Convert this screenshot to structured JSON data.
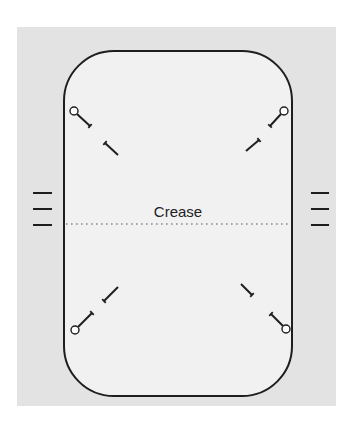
{
  "diagram": {
    "crease_label": "Crease",
    "colors": {
      "page_background": "#ffffff",
      "panel_fill": "#e3e3e3",
      "card_fill": "#f1f1f1",
      "stroke": "#1e1e1e",
      "crease_dots": "#8a8a8a",
      "pin_head_fill": "#ffffff"
    },
    "panel": {
      "x": 17,
      "y": 27,
      "width": 319,
      "height": 379
    },
    "card": {
      "x": 64,
      "y": 51,
      "width": 228,
      "height": 345,
      "corner_radius": 50
    },
    "crease": {
      "y": 224,
      "x1": 66,
      "x2": 290
    },
    "tick_marks": {
      "left": {
        "x1": 33,
        "x2": 52,
        "ys": [
          193,
          209,
          225
        ]
      },
      "right": {
        "x1": 311,
        "x2": 329,
        "ys": [
          193,
          209,
          225
        ]
      }
    },
    "pins": [
      {
        "corner": "top-left",
        "head": [
          74,
          111
        ],
        "shaft": [
          [
            77,
            114
          ],
          [
            90,
            126
          ]
        ],
        "tail": [
          [
            105,
            143
          ],
          [
            118,
            155
          ]
        ]
      },
      {
        "corner": "top-right",
        "head": [
          284,
          111
        ],
        "shaft": [
          [
            281,
            114
          ],
          [
            270,
            126
          ]
        ],
        "tail": [
          [
            259,
            140
          ],
          [
            246,
            151
          ]
        ]
      },
      {
        "corner": "bottom-left",
        "head": [
          75,
          330
        ],
        "shaft": [
          [
            78,
            327
          ],
          [
            92,
            313
          ]
        ],
        "tail": [
          [
            104,
            301
          ],
          [
            118,
            287
          ]
        ]
      },
      {
        "corner": "bottom-right",
        "head": [
          286,
          329
        ],
        "shaft": [
          [
            283,
            326
          ],
          [
            271,
            314
          ]
        ],
        "tail": [
          [
            252,
            295
          ],
          [
            241,
            284
          ]
        ]
      }
    ]
  }
}
